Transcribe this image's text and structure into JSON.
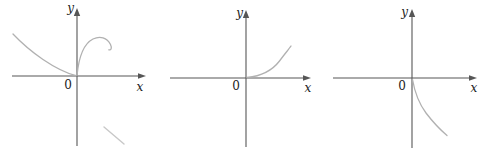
{
  "figure": {
    "colors": {
      "background": "#ffffff",
      "axis": "#565656",
      "curve": "#b1b1b1",
      "label": "#1c1c1c",
      "stray_mark": "#c8c8c8"
    },
    "panels": [
      {
        "y_label": "y",
        "x_label": "x",
        "origin_label": "0",
        "curve": "decreasing concave-up curve from upper left tangent to the x-axis at the origin, plus a hook-shaped arc rising from the origin into the first quadrant and curling back; faint stray diagonal mark in lower right"
      },
      {
        "y_label": "y",
        "x_label": "x",
        "origin_label": "0",
        "curve": "exponential-style curve tangent to the x-axis at the origin rising steeply into the first quadrant"
      },
      {
        "y_label": "y",
        "x_label": "x",
        "origin_label": "0",
        "curve": "curve falling steeply from the origin into the fourth quadrant, easing to a diagonal descent"
      }
    ]
  }
}
